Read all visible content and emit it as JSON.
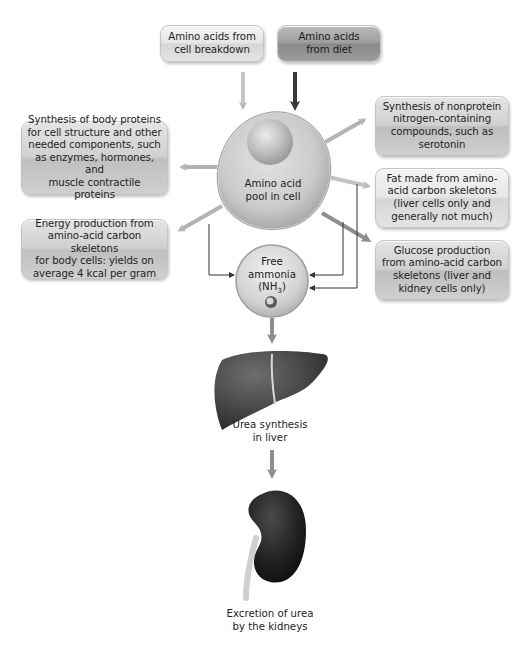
{
  "diagram": {
    "sources": [
      {
        "id": "cell-breakdown",
        "text": "Amino acids from cell breakdown",
        "lines": [
          "Amino acids from",
          "cell breakdown"
        ],
        "style": "light"
      },
      {
        "id": "diet",
        "text": "Amino acids from diet",
        "lines": [
          "Amino acids",
          "from diet"
        ],
        "style": "dark"
      }
    ],
    "pool": {
      "lines": [
        "Amino acid",
        "pool in cell"
      ]
    },
    "outputs": {
      "body_proteins": {
        "lines": [
          "Synthesis of body proteins",
          "for cell structure and other",
          "needed components, such",
          "as enzymes, hormones, and",
          "muscle contractile proteins"
        ]
      },
      "energy": {
        "lines": [
          "Energy production from",
          "amino-acid carbon skeletons",
          "for body cells: yields on",
          "average 4 kcal per gram"
        ]
      },
      "nonprotein": {
        "lines": [
          "Synthesis of nonprotein",
          "nitrogen-containing",
          "compounds, such as",
          "serotonin"
        ]
      },
      "fat": {
        "lines": [
          "Fat made from amino-",
          "acid carbon skeletons",
          "(liver cells only and",
          "generally not much)"
        ]
      },
      "glucose": {
        "lines": [
          "Glucose production",
          "from amino-acid carbon",
          "skeletons (liver and",
          "kidney cells only)"
        ]
      }
    },
    "ammonia": {
      "line1": "Free",
      "line2": "ammonia",
      "line3_prefix": "(NH",
      "line3_sub": "3",
      "line3_suffix": ")"
    },
    "liver": {
      "lines": [
        "Urea synthesis",
        "in liver"
      ]
    },
    "kidney": {
      "lines": [
        "Excretion of urea",
        "by the kidneys"
      ]
    },
    "colors": {
      "arrow_light": "#b8b8b8",
      "arrow_medium": "#8f8f8f",
      "arrow_dark": "#3a3a3a",
      "line_thin": "#333333",
      "cell_fill": "#cfcfcf",
      "organ_fill": "#3c3c3c"
    }
  }
}
